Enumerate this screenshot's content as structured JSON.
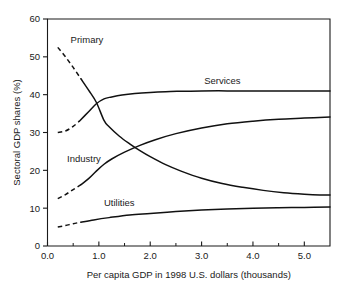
{
  "chart_data": {
    "type": "line",
    "title": "",
    "xlabel": "Per capita GDP in 1998 U.S. dollars (thousands)",
    "ylabel": "Sectoral GDP shares (%)",
    "xlim": [
      0.0,
      5.5
    ],
    "ylim": [
      0,
      60
    ],
    "grid": false,
    "legend_position": "inline-labels",
    "xticks": [
      0.0,
      1.0,
      2.0,
      3.0,
      4.0,
      5.0
    ],
    "xtick_labels": [
      "0.0",
      "1.0",
      "2.0",
      "3.0",
      "4.0",
      "5.0"
    ],
    "xticks_minor": [
      0.5,
      1.5,
      2.5,
      3.5,
      4.5
    ],
    "yticks": [
      0,
      10,
      20,
      30,
      40,
      50,
      60
    ],
    "ytick_labels": [
      "0",
      "10",
      "20",
      "30",
      "40",
      "50",
      "60"
    ],
    "series": [
      {
        "name": "Primary",
        "label": "Primary",
        "label_x": 0.45,
        "label_y": 54.5,
        "color": "#111111",
        "dashed_segment": {
          "x": [
            0.2,
            0.35,
            0.5,
            0.65
          ],
          "y": [
            52.5,
            50.0,
            47.2,
            44.2
          ]
        },
        "x": [
          0.65,
          0.8,
          0.95,
          1.1,
          1.2,
          1.4,
          1.6,
          1.8,
          2.0,
          2.3,
          2.6,
          3.0,
          3.4,
          3.8,
          4.2,
          4.6,
          5.0,
          5.3,
          5.5
        ],
        "y": [
          44.2,
          41.2,
          38.0,
          33.2,
          31.5,
          29.0,
          27.0,
          25.2,
          23.6,
          21.5,
          19.8,
          17.9,
          16.5,
          15.5,
          14.7,
          14.1,
          13.7,
          13.5,
          13.5
        ]
      },
      {
        "name": "Services",
        "label": "Services",
        "label_x": 3.05,
        "label_y": 43.6,
        "color": "#111111",
        "dashed_segment": {
          "x": [
            0.2,
            0.35,
            0.5,
            0.62
          ],
          "y": [
            30.0,
            30.4,
            31.6,
            33.0
          ]
        },
        "x": [
          0.62,
          0.8,
          0.95,
          1.1,
          1.25,
          1.45,
          1.7,
          2.0,
          2.3,
          2.6,
          3.0,
          3.5,
          4.0,
          4.5,
          5.0,
          5.5
        ],
        "y": [
          33.0,
          35.5,
          37.6,
          38.9,
          39.4,
          39.9,
          40.3,
          40.6,
          40.8,
          40.9,
          41.0,
          41.0,
          41.0,
          41.0,
          41.0,
          41.0
        ]
      },
      {
        "name": "Industry",
        "label": "Industry",
        "label_x": 0.38,
        "label_y": 23.2,
        "color": "#111111",
        "dashed_segment": {
          "x": [
            0.2,
            0.35,
            0.5,
            0.65
          ],
          "y": [
            12.5,
            13.6,
            14.9,
            16.2
          ]
        },
        "x": [
          0.65,
          0.8,
          0.95,
          1.1,
          1.25,
          1.5,
          1.8,
          2.1,
          2.5,
          3.0,
          3.5,
          4.0,
          4.5,
          5.0,
          5.5
        ],
        "y": [
          16.2,
          17.8,
          19.8,
          21.6,
          23.0,
          24.8,
          26.6,
          28.1,
          29.7,
          31.2,
          32.3,
          33.0,
          33.5,
          33.8,
          34.1
        ]
      },
      {
        "name": "Utilities",
        "label": "Utilities",
        "label_x": 1.1,
        "label_y": 11.6,
        "color": "#111111",
        "dashed_segment": {
          "x": [
            0.2,
            0.35,
            0.5,
            0.65
          ],
          "y": [
            5.0,
            5.4,
            5.9,
            6.3
          ]
        },
        "x": [
          0.65,
          0.9,
          1.2,
          1.6,
          2.0,
          2.5,
          3.0,
          3.5,
          4.0,
          4.5,
          5.0,
          5.5
        ],
        "y": [
          6.3,
          6.9,
          7.5,
          8.2,
          8.6,
          9.1,
          9.5,
          9.8,
          10.0,
          10.1,
          10.2,
          10.3
        ]
      }
    ]
  }
}
